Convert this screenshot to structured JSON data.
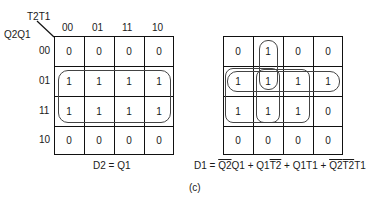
{
  "left_map": {
    "col_var": "T2T1",
    "row_var": "Q2Q1",
    "col_labels": [
      "00",
      "01",
      "11",
      "10"
    ],
    "row_labels": [
      "00",
      "01",
      "11",
      "10"
    ],
    "cells": [
      [
        "0",
        "0",
        "0",
        "0"
      ],
      [
        "1",
        "1",
        "1",
        "1"
      ],
      [
        "1",
        "1",
        "1",
        "1"
      ],
      [
        "0",
        "0",
        "0",
        "0"
      ]
    ],
    "equation": "D2 = Q1"
  },
  "right_map": {
    "cells": [
      [
        "0",
        "1",
        "0",
        "0"
      ],
      [
        "1",
        "1",
        "1",
        "1"
      ],
      [
        "1",
        "1",
        "1",
        "0"
      ],
      [
        "0",
        "0",
        "0",
        "0"
      ]
    ],
    "equation_prefix": "D1 = ",
    "terms": [
      {
        "over": "Q2",
        "plain": "Q1"
      },
      {
        "sep": " + "
      },
      {
        "plain": "Q1",
        "over": "T2"
      },
      {
        "sep": " + "
      },
      {
        "plain": "Q1T1"
      },
      {
        "sep": " + "
      },
      {
        "over": "Q2T2",
        "plain": "T1"
      }
    ],
    "eq_parts": {
      "p1_over": "Q2",
      "p1_plain": "Q1",
      "s1": " + ",
      "p2_plain": "Q1",
      "p2_over": "T2",
      "s2": " + ",
      "p3_plain": "Q1T1",
      "s3": " + ",
      "p4_over": "Q2",
      "p4_over2": "T2",
      "p4_plain": "T1"
    }
  },
  "caption": "(c)"
}
